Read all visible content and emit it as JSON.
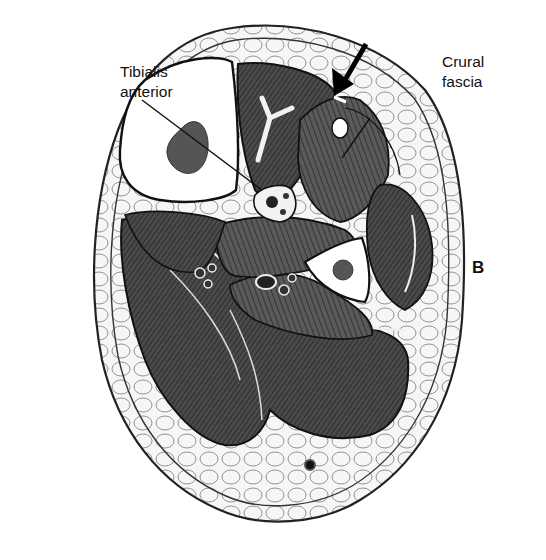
{
  "figure": {
    "panel_letter": "B",
    "labels": [
      {
        "id": "tibialis",
        "line1": "Tibialis",
        "line2": "anterior"
      },
      {
        "id": "crural",
        "line1": "Crural",
        "line2": "fascia"
      }
    ],
    "arrow": "arrow pointing to crural fascia incision",
    "colors": {
      "ink": "#111111",
      "muscle_dark": "#3a3a3a",
      "muscle_mid": "#5c5c5c",
      "bone": "#ffffff",
      "fat": "#f4f4f4",
      "background": "#ffffff"
    }
  }
}
